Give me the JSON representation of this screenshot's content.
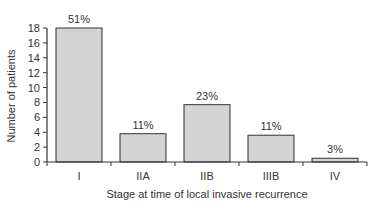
{
  "chart_data": {
    "type": "bar",
    "title": "",
    "xlabel": "Stage at time of local invasive recurrence",
    "ylabel": "Number of patients",
    "categories": [
      "I",
      "IIA",
      "IIB",
      "IIIB",
      "IV"
    ],
    "values": [
      18,
      3.8,
      7.7,
      3.6,
      0.5
    ],
    "data_labels": [
      "51%",
      "11%",
      "23%",
      "11%",
      "3%"
    ],
    "yticks": [
      0,
      2,
      4,
      6,
      8,
      10,
      12,
      14,
      16,
      18
    ],
    "ylim": [
      0,
      18
    ],
    "grid": false,
    "legend": null,
    "colors": {
      "bar_fill": "#d4d4d4",
      "bar_stroke": "#333333",
      "axis": "#333333",
      "text": "#333333"
    }
  }
}
